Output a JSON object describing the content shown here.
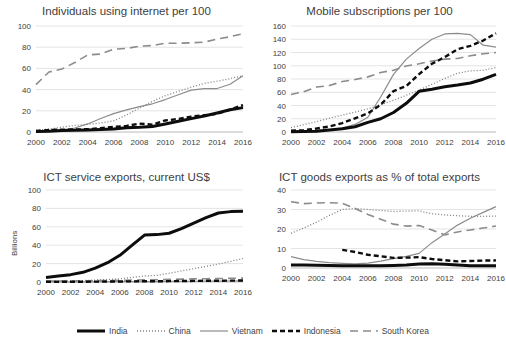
{
  "figure": {
    "title": "",
    "series_styles": {
      "India": {
        "color": "#0d0d0d",
        "width": 3.0,
        "dash": "none"
      },
      "China": {
        "color": "#7f7f7f",
        "width": 1.3,
        "dash": "1,2"
      },
      "Vietnam": {
        "color": "#8c8c8c",
        "width": 1.2,
        "dash": "none"
      },
      "Indonesia": {
        "color": "#0d0d0d",
        "width": 2.4,
        "dash": "5,3"
      },
      "South Korea": {
        "color": "#8c8c8c",
        "width": 1.6,
        "dash": "8,5"
      }
    }
  },
  "legend": {
    "position": "bottom-center",
    "items": [
      {
        "label": "India",
        "style": "thick-solid-black"
      },
      {
        "label": "China",
        "style": "fine-dotted-gray"
      },
      {
        "label": "Vietnam",
        "style": "thin-solid-gray"
      },
      {
        "label": "Indonesia",
        "style": "thick-dashed-black"
      },
      {
        "label": "South Korea",
        "style": "long-dashed-gray"
      }
    ]
  },
  "chart_data": [
    {
      "id": "internet",
      "type": "line",
      "title": "Individuals using internet per 100",
      "xlabel": "",
      "ylabel": "",
      "grid": true,
      "legend": "shared-bottom",
      "x": [
        2000,
        2001,
        2002,
        2003,
        2004,
        2005,
        2006,
        2007,
        2008,
        2009,
        2010,
        2011,
        2012,
        2013,
        2014,
        2015,
        2016
      ],
      "xticks": [
        2000,
        2002,
        2004,
        2006,
        2008,
        2010,
        2012,
        2014,
        2016
      ],
      "ylim": [
        0,
        100
      ],
      "yticks": [
        0,
        20,
        40,
        60,
        80,
        100
      ],
      "series": [
        {
          "name": "India",
          "values": [
            0.5,
            0.7,
            1.5,
            1.7,
            2.0,
            2.4,
            2.8,
            4.0,
            4.4,
            5.1,
            7.5,
            10.1,
            12.6,
            15.1,
            18.0,
            21.0,
            23.0
          ]
        },
        {
          "name": "China",
          "values": [
            1.8,
            2.6,
            4.6,
            6.2,
            7.3,
            8.5,
            10.5,
            16.0,
            22.6,
            28.9,
            34.3,
            38.3,
            42.3,
            45.8,
            47.9,
            50.3,
            53.2
          ]
        },
        {
          "name": "Vietnam",
          "values": [
            0.3,
            1.3,
            1.9,
            3.8,
            7.6,
            12.7,
            17.3,
            20.8,
            24.0,
            26.6,
            30.6,
            35.1,
            39.5,
            41.0,
            41.0,
            45.0,
            53.0
          ]
        },
        {
          "name": "Indonesia",
          "values": [
            0.9,
            2.0,
            2.1,
            2.4,
            2.6,
            3.6,
            4.8,
            5.8,
            7.9,
            6.9,
            10.9,
            12.3,
            14.5,
            15.8,
            17.1,
            21.1,
            25.4
          ]
        },
        {
          "name": "South Korea",
          "values": [
            44.7,
            56.6,
            59.4,
            65.5,
            72.7,
            73.5,
            78.1,
            78.8,
            81.0,
            81.6,
            83.7,
            83.8,
            84.1,
            84.8,
            87.6,
            89.9,
            92.8
          ]
        }
      ]
    },
    {
      "id": "mobile",
      "type": "line",
      "title": "Mobile subscriptions per 100",
      "xlabel": "",
      "ylabel": "",
      "grid": true,
      "legend": "shared-bottom",
      "x": [
        2000,
        2001,
        2002,
        2003,
        2004,
        2005,
        2006,
        2007,
        2008,
        2009,
        2010,
        2011,
        2012,
        2013,
        2014,
        2015,
        2016
      ],
      "xticks": [
        2000,
        2002,
        2004,
        2006,
        2008,
        2010,
        2012,
        2014,
        2016
      ],
      "ylim": [
        0,
        160
      ],
      "yticks": [
        0,
        20,
        40,
        60,
        80,
        100,
        120,
        140,
        160
      ],
      "series": [
        {
          "name": "India",
          "values": [
            0.3,
            0.6,
            1.2,
            3.0,
            4.9,
            7.9,
            14.6,
            20.0,
            29.4,
            43.3,
            61.4,
            64.5,
            68.4,
            70.8,
            74.0,
            79.7,
            87.0
          ]
        },
        {
          "name": "China",
          "values": [
            6.6,
            11.1,
            15.8,
            20.8,
            25.5,
            30.0,
            34.9,
            41.3,
            47.9,
            55.4,
            63.2,
            72.0,
            80.8,
            88.7,
            92.3,
            93.2,
            97.3
          ]
        },
        {
          "name": "Vietnam",
          "values": [
            1.0,
            1.5,
            2.3,
            3.4,
            6.0,
            11.4,
            22.3,
            52.9,
            87.0,
            110.0,
            126.0,
            140.0,
            148.0,
            149.0,
            147.0,
            131.0,
            128.0
          ]
        },
        {
          "name": "Indonesia",
          "values": [
            1.8,
            2.9,
            5.3,
            8.3,
            13.5,
            20.7,
            28.1,
            41.0,
            61.8,
            69.3,
            87.4,
            103.0,
            113.0,
            125.0,
            130.0,
            138.0,
            149.0
          ]
        },
        {
          "name": "South Korea",
          "values": [
            56.6,
            60.8,
            67.9,
            70.1,
            76.1,
            79.2,
            83.2,
            89.9,
            93.2,
            99.7,
            103.0,
            107.0,
            110.0,
            111.0,
            115.0,
            118.0,
            120.0
          ]
        }
      ]
    },
    {
      "id": "ict-services",
      "type": "line",
      "title": "ICT service exports, current US$",
      "xlabel": "",
      "ylabel": "Billions",
      "grid": true,
      "legend": "shared-bottom",
      "x": [
        2000,
        2001,
        2002,
        2003,
        2004,
        2005,
        2006,
        2007,
        2008,
        2009,
        2010,
        2011,
        2012,
        2013,
        2014,
        2015,
        2016
      ],
      "xticks": [
        2000,
        2002,
        2004,
        2006,
        2008,
        2010,
        2012,
        2014,
        2016
      ],
      "ylim": [
        0,
        100
      ],
      "yticks": [
        0,
        20,
        40,
        60,
        80,
        100
      ],
      "series": [
        {
          "name": "India",
          "values": [
            5.0,
            6.5,
            8.0,
            10.5,
            15.0,
            21.0,
            29.0,
            40.0,
            51.0,
            51.5,
            53.0,
            58.0,
            64.0,
            70.0,
            75.0,
            76.5,
            77.0
          ]
        },
        {
          "name": "China",
          "values": [
            0.8,
            1.0,
            1.3,
            1.6,
            2.1,
            2.7,
            3.5,
            5.0,
            6.5,
            7.3,
            9.5,
            12.0,
            14.5,
            17.0,
            19.5,
            22.5,
            25.5
          ]
        },
        {
          "name": "Vietnam",
          "values": [
            0.1,
            0.1,
            0.1,
            0.2,
            0.2,
            0.3,
            0.3,
            0.4,
            0.5,
            0.5,
            0.6,
            0.7,
            0.8,
            0.9,
            1.0,
            1.1,
            1.2
          ]
        },
        {
          "name": "Indonesia",
          "values": [
            0.2,
            0.2,
            0.3,
            0.3,
            0.4,
            0.5,
            0.6,
            0.7,
            0.8,
            0.8,
            0.9,
            1.1,
            1.2,
            1.3,
            1.4,
            1.5,
            1.6
          ]
        },
        {
          "name": "South Korea",
          "values": [
            0.9,
            1.0,
            1.1,
            1.2,
            1.4,
            1.6,
            1.8,
            2.1,
            2.3,
            2.4,
            2.8,
            3.1,
            3.4,
            3.6,
            3.8,
            4.0,
            4.2
          ]
        }
      ]
    },
    {
      "id": "ict-goods",
      "type": "line",
      "title": "ICT goods exports as % of total exports",
      "xlabel": "",
      "ylabel": "",
      "grid": true,
      "legend": "shared-bottom",
      "x": [
        2000,
        2001,
        2002,
        2003,
        2004,
        2005,
        2006,
        2007,
        2008,
        2009,
        2010,
        2011,
        2012,
        2013,
        2014,
        2015,
        2016
      ],
      "xticks": [
        2000,
        2002,
        2004,
        2006,
        2008,
        2010,
        2012,
        2014,
        2016
      ],
      "ylim": [
        0,
        40
      ],
      "yticks": [
        0,
        10,
        20,
        30,
        40
      ],
      "series": [
        {
          "name": "India",
          "values": [
            1.6,
            1.5,
            1.4,
            1.3,
            1.2,
            1.1,
            1.1,
            1.2,
            1.3,
            1.5,
            2.0,
            2.2,
            1.9,
            1.5,
            1.2,
            1.1,
            1.2
          ]
        },
        {
          "name": "China",
          "values": [
            17.8,
            20.5,
            23.5,
            27.0,
            30.0,
            30.6,
            30.0,
            29.5,
            29.0,
            29.2,
            29.3,
            27.8,
            27.2,
            26.8,
            26.5,
            26.5,
            26.6
          ]
        },
        {
          "name": "Vietnam",
          "values": [
            5.8,
            4.3,
            3.4,
            2.8,
            2.4,
            2.1,
            2.5,
            3.5,
            4.8,
            6.0,
            7.5,
            13.0,
            17.5,
            22.0,
            25.5,
            28.5,
            31.5
          ]
        },
        {
          "name": "Indonesia",
          "values": [
            null,
            null,
            null,
            null,
            9.3,
            8.2,
            6.8,
            6.0,
            5.2,
            5.3,
            5.6,
            4.6,
            4.0,
            3.4,
            3.6,
            3.8,
            3.9
          ]
        },
        {
          "name": "South Korea",
          "values": [
            34.0,
            33.0,
            33.3,
            33.5,
            33.2,
            30.5,
            27.5,
            25.0,
            22.5,
            21.5,
            21.8,
            19.5,
            17.0,
            18.5,
            19.5,
            20.5,
            21.5
          ]
        }
      ]
    }
  ]
}
